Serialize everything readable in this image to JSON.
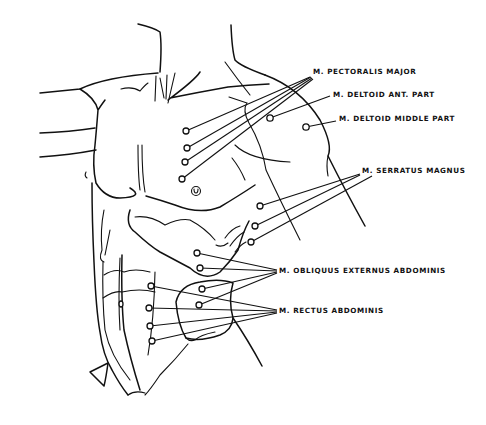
{
  "diagram": {
    "line_color": "#111111",
    "background": "#ffffff",
    "labels": [
      {
        "id": "pectoralis-major",
        "text": "M. PECTORALIS MAJOR",
        "x": 313,
        "y": 68
      },
      {
        "id": "deltoid-ant",
        "text": "M. DELTOID ANT. PART",
        "x": 333,
        "y": 91
      },
      {
        "id": "deltoid-middle",
        "text": "M. DELTOID MIDDLE PART",
        "x": 339,
        "y": 115
      },
      {
        "id": "serratus-magnus",
        "text": "M. SERRATUS MAGNUS",
        "x": 362,
        "y": 167
      },
      {
        "id": "obliquus-externus",
        "text": "M. OBLIQUUS EXTERNUS ABDOMINIS",
        "x": 279,
        "y": 267
      },
      {
        "id": "rectus-abdominis",
        "text": "M. RECTUS ABDOMINIS",
        "x": 279,
        "y": 307
      }
    ],
    "motor_points": {
      "pectoralis_major": [
        [
          186,
          131
        ],
        [
          187,
          148
        ],
        [
          185,
          162
        ],
        [
          182,
          179
        ]
      ],
      "deltoid_ant": [
        [
          270,
          118
        ]
      ],
      "deltoid_middle": [
        [
          306,
          127
        ]
      ],
      "serratus_magnus": [
        [
          260,
          206
        ],
        [
          255,
          226
        ],
        [
          251,
          242
        ]
      ],
      "obliquus_externus": [
        [
          197,
          253
        ],
        [
          200,
          268
        ],
        [
          202,
          289
        ],
        [
          199,
          305
        ]
      ],
      "rectus_abdominis": [
        [
          151,
          286
        ],
        [
          149,
          308
        ],
        [
          150,
          326
        ],
        [
          152,
          341
        ]
      ]
    },
    "navel_symbol": "u"
  }
}
